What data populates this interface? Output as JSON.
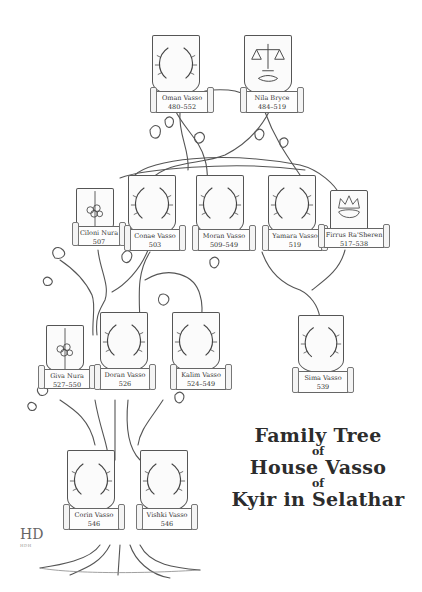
{
  "title": {
    "line1": "Family Tree",
    "of1": "of",
    "line2": "House Vasso",
    "of2": "of",
    "line3": "Kyir in Selathar"
  },
  "signature": {
    "monogram": "HD",
    "sub": "HDH"
  },
  "members": [
    {
      "id": "oman",
      "name": "Oman Vasso",
      "dates": "480–552",
      "emblem": "wreath",
      "generation": 1
    },
    {
      "id": "nila",
      "name": "Nila Bryce",
      "dates": "484–519",
      "emblem": "scales-handshake",
      "generation": 1
    },
    {
      "id": "ciloni",
      "name": "Ciloni Nura",
      "dates": "507",
      "emblem": "flower",
      "generation": 2
    },
    {
      "id": "conae",
      "name": "Conae Vasso",
      "dates": "503",
      "emblem": "wreath",
      "generation": 2
    },
    {
      "id": "moran",
      "name": "Moran Vasso",
      "dates": "509–549",
      "emblem": "wreath",
      "generation": 2
    },
    {
      "id": "yamara",
      "name": "Yamara Vasso",
      "dates": "519",
      "emblem": "wreath",
      "generation": 2
    },
    {
      "id": "firrus",
      "name": "Firrus Ra'Sheren",
      "dates": "517–538",
      "emblem": "crown",
      "generation": 2
    },
    {
      "id": "giva",
      "name": "Giva Nura",
      "dates": "527–550",
      "emblem": "flower",
      "generation": 3
    },
    {
      "id": "doran",
      "name": "Doran Vasso",
      "dates": "526",
      "emblem": "wreath",
      "generation": 3
    },
    {
      "id": "kalim",
      "name": "Kalim Vasso",
      "dates": "524–549",
      "emblem": "wreath",
      "generation": 3
    },
    {
      "id": "sima",
      "name": "Sima Vasso",
      "dates": "539",
      "emblem": "wreath",
      "generation": 3
    },
    {
      "id": "corin",
      "name": "Corin Vasso",
      "dates": "546",
      "emblem": "wreath",
      "generation": 4
    },
    {
      "id": "vishki",
      "name": "Vishki Vasso",
      "dates": "546",
      "emblem": "wreath",
      "generation": 4
    }
  ],
  "colors": {
    "ink": "#3a3a3a",
    "paper": "#ffffff",
    "branch": "#555555"
  }
}
